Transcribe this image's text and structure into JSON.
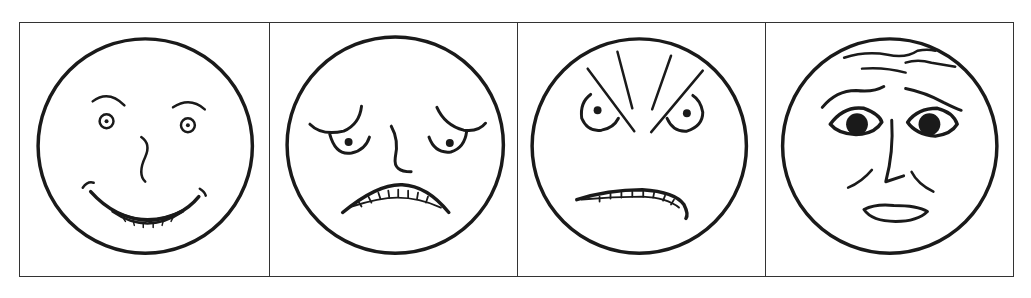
{
  "figure": {
    "stroke_color": "#1a1a1a",
    "border_color": "#333333",
    "background": "#ffffff",
    "panels": [
      {
        "emotion": "happy",
        "icon": "happy-face-icon"
      },
      {
        "emotion": "sad",
        "icon": "sad-face-icon"
      },
      {
        "emotion": "angry",
        "icon": "angry-face-icon"
      },
      {
        "emotion": "afraid",
        "icon": "afraid-face-icon"
      }
    ]
  }
}
